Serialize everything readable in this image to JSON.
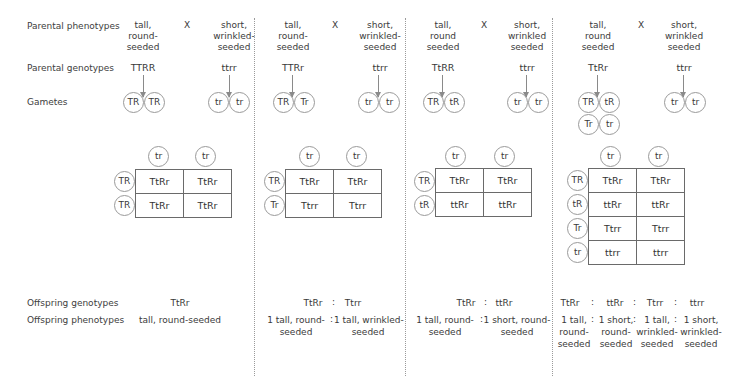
{
  "row_labels": {
    "parental_phenotypes": "Parental phenotypes",
    "parental_genotypes": "Parental genotypes",
    "gametes": "Gametes",
    "offspring_genotypes": "Offspring genotypes",
    "offspring_phenotypes": "Offspring phenotypes"
  },
  "cross_symbol": "X",
  "ratio_separator": ":",
  "crosses": [
    {
      "parent1": {
        "phenotype_l1": "tall,",
        "phenotype_l2": "round-",
        "phenotype_l3": "seeded",
        "genotype": "TTRR",
        "gametes": [
          "TR",
          "TR"
        ]
      },
      "parent2": {
        "phenotype_l1": "short,",
        "phenotype_l2": "wrinkled-",
        "phenotype_l3": "seeded",
        "genotype": "ttrr",
        "gametes": [
          "tr",
          "tr"
        ]
      },
      "punnett": {
        "cols": [
          "tr",
          "tr"
        ],
        "rows": [
          "TR",
          "TR"
        ],
        "cells": [
          [
            "TtRr",
            "TtRr"
          ],
          [
            "TtRr",
            "TtRr"
          ]
        ]
      },
      "offspring_genotypes": [
        "TtRr"
      ],
      "offspring_phenotypes": [
        [
          "tall, round-seeded"
        ]
      ]
    },
    {
      "parent1": {
        "phenotype_l1": "tall,",
        "phenotype_l2": "round-",
        "phenotype_l3": "seeded",
        "genotype": "TTRr",
        "gametes": [
          "TR",
          "Tr"
        ]
      },
      "parent2": {
        "phenotype_l1": "short,",
        "phenotype_l2": "wrinkled-",
        "phenotype_l3": "seeded",
        "genotype": "ttrr",
        "gametes": [
          "tr",
          "tr"
        ]
      },
      "punnett": {
        "cols": [
          "tr",
          "tr"
        ],
        "rows": [
          "TR",
          "Tr"
        ],
        "cells": [
          [
            "TtRr",
            "TtRr"
          ],
          [
            "Ttrr",
            "Ttrr"
          ]
        ]
      },
      "offspring_genotypes": [
        "TtRr",
        "Ttrr"
      ],
      "offspring_phenotypes": [
        [
          "1 tall, round-",
          "seeded"
        ],
        [
          "1 tall, wrinkled-",
          "seeded"
        ]
      ]
    },
    {
      "parent1": {
        "phenotype_l1": "tall,",
        "phenotype_l2": "round",
        "phenotype_l3": "seeded",
        "genotype": "TtRR",
        "gametes": [
          "TR",
          "tR"
        ]
      },
      "parent2": {
        "phenotype_l1": "short,",
        "phenotype_l2": "wrinkled",
        "phenotype_l3": "seeded",
        "genotype": "ttrr",
        "gametes": [
          "tr",
          "tr"
        ]
      },
      "punnett": {
        "cols": [
          "tr",
          "tr"
        ],
        "rows": [
          "TR",
          "tR"
        ],
        "cells": [
          [
            "TtRr",
            "TtRr"
          ],
          [
            "ttRr",
            "ttRr"
          ]
        ]
      },
      "offspring_genotypes": [
        "TtRr",
        "ttRr"
      ],
      "offspring_phenotypes": [
        [
          "1 tall, round-",
          "seeded"
        ],
        [
          "1 short, round-",
          "seeded"
        ]
      ]
    },
    {
      "parent1": {
        "phenotype_l1": "tall,",
        "phenotype_l2": "round",
        "phenotype_l3": "seeded",
        "genotype": "TtRr",
        "gametes": [
          "TR",
          "tR",
          "Tr",
          "tr"
        ]
      },
      "parent2": {
        "phenotype_l1": "short,",
        "phenotype_l2": "wrinkled",
        "phenotype_l3": "seeded",
        "genotype": "ttrr",
        "gametes": [
          "tr",
          "tr"
        ]
      },
      "punnett": {
        "cols": [
          "tr",
          "tr"
        ],
        "rows": [
          "TR",
          "tR",
          "Tr",
          "tr"
        ],
        "cells": [
          [
            "TtRr",
            "TtRr"
          ],
          [
            "ttRr",
            "ttRr"
          ],
          [
            "Ttrr",
            "Ttrr"
          ],
          [
            "ttrr",
            "ttrr"
          ]
        ]
      },
      "offspring_genotypes": [
        "TtRr",
        "ttRr",
        "Ttrr",
        "ttrr"
      ],
      "offspring_phenotypes": [
        [
          "1 tall,",
          "round-",
          "seeded"
        ],
        [
          "1 short,",
          "round-",
          "seeded"
        ],
        [
          "1 tall,",
          "wrinkled-",
          "seeded"
        ],
        [
          "1 short,",
          "wrinkled-",
          "seeded"
        ]
      ]
    }
  ]
}
